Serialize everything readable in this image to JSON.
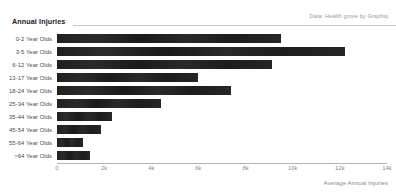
{
  "header": {
    "title": "Annual Injuries",
    "source_note": "Data: Health grove by Graphiq"
  },
  "chart_data": {
    "type": "bar",
    "orientation": "horizontal",
    "title": "Annual Injuries",
    "xlabel": "Average Annual Injuries",
    "ylabel": "",
    "xlim": [
      0,
      14000
    ],
    "grid": false,
    "legend": null,
    "bar_color": "#1c1c1c",
    "xtick_labels": [
      "0",
      "2k",
      "4k",
      "6k",
      "8k",
      "10k",
      "12k",
      "14k"
    ],
    "xtick_values": [
      0,
      2000,
      4000,
      6000,
      8000,
      10000,
      12000,
      14000
    ],
    "categories": [
      "0-2 Year Olds",
      "3-5 Year Olds",
      "6-12 Year Olds",
      "13-17 Year Olds",
      "18-24 Year Olds",
      "25-34 Year Olds",
      "35-44 Year Olds",
      "45-54 Year Olds",
      "55-64 Year Olds",
      ">64 Year Olds"
    ],
    "values": [
      9500,
      12200,
      9100,
      6000,
      7400,
      4400,
      2350,
      1850,
      1100,
      1400
    ]
  }
}
